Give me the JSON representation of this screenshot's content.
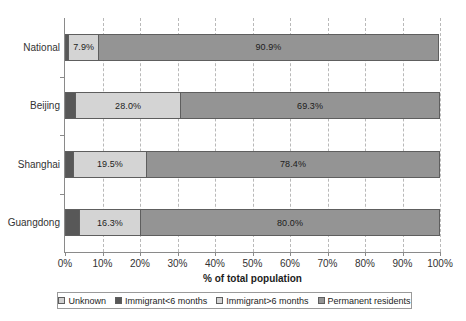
{
  "chart_data": {
    "type": "bar",
    "orientation": "horizontal",
    "stacked": true,
    "title": "",
    "xlabel": "% of total population",
    "ylabel": "",
    "xlim": [
      0,
      100
    ],
    "xticks": [
      "0%",
      "10%",
      "20%",
      "30%",
      "40%",
      "50%",
      "60%",
      "70%",
      "80%",
      "90%",
      "100%"
    ],
    "xtick_values": [
      0,
      10,
      20,
      30,
      40,
      50,
      60,
      70,
      80,
      90,
      100
    ],
    "grid": "vertical-dashed",
    "legend_position": "bottom",
    "categories": [
      "National",
      "Beijing",
      "Shanghai",
      "Guangdong"
    ],
    "series": [
      {
        "name": "Unknown",
        "color": "#d0d0d0",
        "values": [
          0.3,
          0.0,
          0.0,
          0.0
        ]
      },
      {
        "name": "Immigrant<6 months",
        "color": "#585858",
        "values": [
          0.9,
          2.7,
          2.1,
          3.7
        ]
      },
      {
        "name": "Immigrant>6 months",
        "color": "#d4d4d4",
        "values": [
          7.9,
          28.0,
          19.5,
          16.3
        ]
      },
      {
        "name": "Permanent residents",
        "color": "#949494",
        "values": [
          90.9,
          69.3,
          78.4,
          80.0
        ]
      }
    ],
    "data_labels": {
      "National": {
        "immigrant_gt6": "7.9%",
        "permanent": "90.9%"
      },
      "Beijing": {
        "immigrant_gt6": "28.0%",
        "permanent": "69.3%"
      },
      "Shanghai": {
        "immigrant_gt6": "19.5%",
        "permanent": "78.4%"
      },
      "Guangdong": {
        "immigrant_gt6": "16.3%",
        "permanent": "80.0%"
      }
    },
    "bars": [
      {
        "category": "National",
        "segments": [
          {
            "series": "Immigrant<6 months",
            "start": 0.0,
            "size": 0.9,
            "label": ""
          },
          {
            "series": "Immigrant>6 months",
            "start": 0.9,
            "size": 7.9,
            "label": "7.9%"
          },
          {
            "series": "Permanent residents",
            "start": 8.8,
            "size": 90.9,
            "label": "90.9%"
          }
        ]
      },
      {
        "category": "Beijing",
        "segments": [
          {
            "series": "Immigrant<6 months",
            "start": 0.0,
            "size": 2.7,
            "label": ""
          },
          {
            "series": "Immigrant>6 months",
            "start": 2.7,
            "size": 28.0,
            "label": "28.0%"
          },
          {
            "series": "Permanent residents",
            "start": 30.7,
            "size": 69.3,
            "label": "69.3%"
          }
        ]
      },
      {
        "category": "Shanghai",
        "segments": [
          {
            "series": "Immigrant<6 months",
            "start": 0.0,
            "size": 2.1,
            "label": ""
          },
          {
            "series": "Immigrant>6 months",
            "start": 2.1,
            "size": 19.5,
            "label": "19.5%"
          },
          {
            "series": "Permanent residents",
            "start": 21.6,
            "size": 78.4,
            "label": "78.4%"
          }
        ]
      },
      {
        "category": "Guangdong",
        "segments": [
          {
            "series": "Immigrant<6 months",
            "start": 0.0,
            "size": 3.7,
            "label": ""
          },
          {
            "series": "Immigrant>6 months",
            "start": 3.7,
            "size": 16.3,
            "label": "16.3%"
          },
          {
            "series": "Permanent residents",
            "start": 20.0,
            "size": 80.0,
            "label": "80.0%"
          }
        ]
      }
    ]
  },
  "axis": {
    "x_title": "% of total population",
    "x_ticks": [
      "0%",
      "10%",
      "20%",
      "30%",
      "40%",
      "50%",
      "60%",
      "70%",
      "80%",
      "90%",
      "100%"
    ],
    "y_categories": [
      "National",
      "Beijing",
      "Shanghai",
      "Guangdong"
    ]
  },
  "legend": {
    "items": [
      {
        "label": "Unknown",
        "color": "#d0d0d0"
      },
      {
        "label": "Immigrant<6 months",
        "color": "#585858"
      },
      {
        "label": "Immigrant>6 months",
        "color": "#d4d4d4"
      },
      {
        "label": "Permanent residents",
        "color": "#949494"
      }
    ]
  },
  "colors": {
    "unknown": "#d0d0d0",
    "immigrant_lt6": "#585858",
    "immigrant_gt6": "#d4d4d4",
    "permanent": "#949494",
    "axis": "#8a8a8a",
    "gridline": "#b9b9b9",
    "segment_border": "#5e5e5e"
  }
}
